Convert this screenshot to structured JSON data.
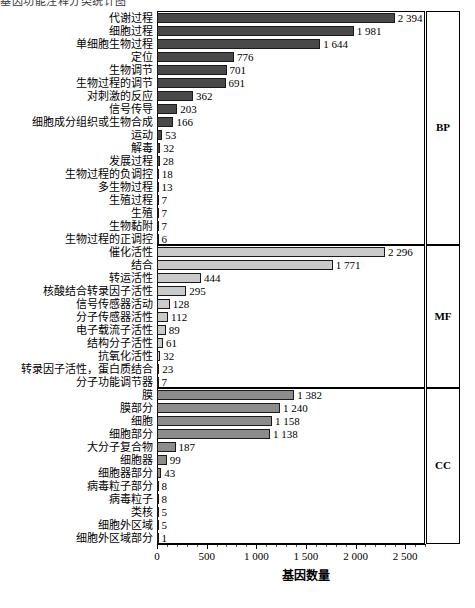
{
  "header": {
    "cropped_text": "基因功能注释分类统计图"
  },
  "axis": {
    "x_title": "基因数量",
    "x_ticks": [
      "0",
      "500",
      "1 000",
      "1 500",
      "2 000",
      "2 500"
    ],
    "x_tick_values": [
      0,
      500,
      1000,
      1500,
      2000,
      2500
    ],
    "x_min": 0,
    "x_max": 2700
  },
  "panels": [
    {
      "code": "BP",
      "label": "BP"
    },
    {
      "code": "MF",
      "label": "MF"
    },
    {
      "code": "CC",
      "label": "CC"
    }
  ],
  "colors": {
    "bp_bar": "#494949",
    "mf_bar": "#cacaca",
    "cc_bar": "#8c8c8c",
    "bar_border": "#1a1a1a",
    "axis": "#000000",
    "background": "#ffffff"
  },
  "chart_data": {
    "type": "bar",
    "orientation": "horizontal",
    "title": "",
    "xlabel": "基因数量",
    "ylabel": "",
    "xlim": [
      0,
      2700
    ],
    "grid": false,
    "legend": "right-panel-labels",
    "series": [
      {
        "name": "BP",
        "color": "#494949",
        "categories": [
          "代谢过程",
          "细胞过程",
          "单细胞生物过程",
          "定位",
          "生物调节",
          "生物过程的调节",
          "对刺激的反应",
          "信号传导",
          "细胞成分组织或生物合成",
          "运动",
          "解毒",
          "发展过程",
          "生物过程的负调控",
          "多生物过程",
          "生殖过程",
          "生殖",
          "生物黏附",
          "生物过程的正调控"
        ],
        "values": [
          2394,
          1981,
          1644,
          776,
          701,
          691,
          362,
          203,
          166,
          53,
          32,
          28,
          18,
          13,
          7,
          7,
          7,
          6
        ],
        "value_labels": [
          "2 394",
          "1 981",
          "1 644",
          "776",
          "701",
          "691",
          "362",
          "203",
          "166",
          "53",
          "32",
          "28",
          "18",
          "13",
          "7",
          "7",
          "7",
          "6"
        ]
      },
      {
        "name": "MF",
        "color": "#cacaca",
        "categories": [
          "催化活性",
          "结合",
          "转运活性",
          "核酸结合转录因子活性",
          "信号传感器活动",
          "分子传感器活性",
          "电子载流子活性",
          "结构分子活性",
          "抗氧化活性",
          "转录因子活性，蛋白质结合",
          "分子功能调节器"
        ],
        "values": [
          2296,
          1771,
          444,
          295,
          128,
          112,
          89,
          61,
          32,
          23,
          7
        ],
        "value_labels": [
          "2 296",
          "1 771",
          "444",
          "295",
          "128",
          "112",
          "89",
          "61",
          "32",
          "23",
          "7"
        ]
      },
      {
        "name": "CC",
        "color": "#8c8c8c",
        "categories": [
          "膜",
          "膜部分",
          "细胞",
          "细胞部分",
          "大分子复合物",
          "细胞器",
          "细胞器部分",
          "病毒粒子部分",
          "病毒粒子",
          "类核",
          "细胞外区域",
          "细胞外区域部分"
        ],
        "values": [
          1382,
          1240,
          1158,
          1138,
          187,
          99,
          43,
          8,
          8,
          5,
          5,
          1
        ],
        "value_labels": [
          "1 382",
          "1 240",
          "1 158",
          "1 138",
          "187",
          "99",
          "43",
          "8",
          "8",
          "5",
          "5",
          "1"
        ]
      }
    ]
  }
}
